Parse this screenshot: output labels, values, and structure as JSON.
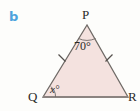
{
  "figure": {
    "part_label": "b",
    "part_label_color": "#4da3dd",
    "background_color": "#fdfdfb",
    "shape": "triangle",
    "fill_color": "#f4e2df",
    "stroke_color": "#6f6a66",
    "base_stroke_color": "#8b8380",
    "vertices": {
      "p": "P",
      "q": "Q",
      "r": "R"
    },
    "angles": {
      "p": "70°",
      "q": "x°",
      "r": ""
    },
    "tick_marks": {
      "side_pq": 1,
      "side_pr": 1,
      "side_qr": 0
    }
  }
}
